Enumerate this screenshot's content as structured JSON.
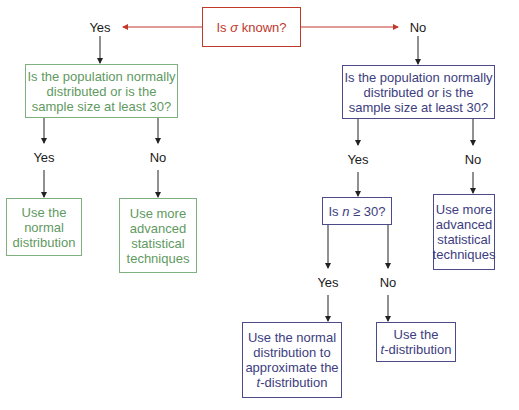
{
  "nodes": {
    "root": {
      "pre": "Is ",
      "sym": "σ",
      "post": " known?"
    },
    "yes_question": {
      "lines": [
        "Is the population normally",
        "distributed or is the",
        "sample size at least 30?"
      ]
    },
    "yes_yes_result": {
      "lines": [
        "Use the",
        "normal",
        "distribution"
      ]
    },
    "yes_no_result": {
      "lines": [
        "Use more",
        "advanced",
        "statistical",
        "techniques"
      ]
    },
    "no_question": {
      "lines": [
        "Is the population normally",
        "distributed or is the",
        "sample size at least 30?"
      ]
    },
    "n_check": {
      "pre": "Is ",
      "sym": "n",
      "post": " ≥ 30?"
    },
    "no_no_result": {
      "lines": [
        "Use more",
        "advanced",
        "statistical",
        "techniques"
      ]
    },
    "n_yes_result": {
      "lines": [
        "Use the normal",
        "distribution to",
        "approximate the"
      ],
      "last_italic": "t",
      "last_rest": "-distribution"
    },
    "n_no_result": {
      "line1": "Use the",
      "last_italic": "t",
      "last_rest": "-distribution"
    }
  },
  "labels": {
    "yes": "Yes",
    "no": "No"
  },
  "colors": {
    "root": "#c0392b",
    "yes_branch": "#5f9a5f",
    "no_branch": "#3d3d80"
  }
}
